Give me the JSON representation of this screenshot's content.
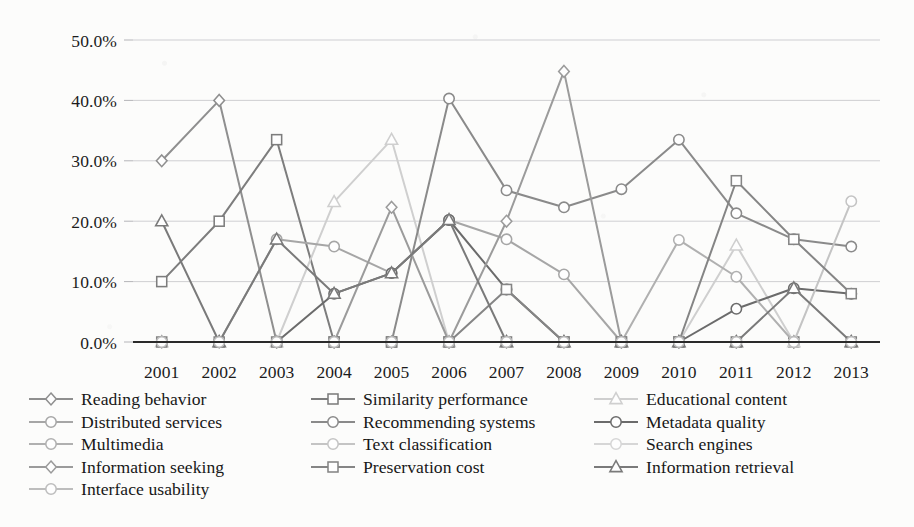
{
  "chart_data": {
    "type": "line",
    "title": "",
    "subtitle": "",
    "xlabel": "",
    "ylabel": "",
    "categories": [
      "2001",
      "2002",
      "2003",
      "2004",
      "2005",
      "2006",
      "2007",
      "2008",
      "2009",
      "2010",
      "2011",
      "2012",
      "2013"
    ],
    "x": [
      2001,
      2002,
      2003,
      2004,
      2005,
      2006,
      2007,
      2008,
      2009,
      2010,
      2011,
      2012,
      2013
    ],
    "ylim": [
      0,
      50
    ],
    "y_tick_labels": [
      "0.0%",
      "10.0%",
      "20.0%",
      "30.0%",
      "40.0%",
      "50.0%"
    ],
    "y_tick_values": [
      0,
      10,
      20,
      30,
      40,
      50
    ],
    "y_unit": "%",
    "grid": "horizontal",
    "legend_position": "bottom",
    "legend_columns": 3,
    "series": [
      {
        "name": "Reading behavior",
        "marker": "diamond",
        "color": "#8f8f8f",
        "values": [
          30.0,
          40.0,
          0.0,
          0.0,
          0.0,
          0.0,
          0.0,
          0.0,
          0.0,
          0.0,
          0.0,
          0.0,
          0.0
        ]
      },
      {
        "name": "Similarity performance",
        "marker": "square",
        "color": "#7d7d7d",
        "values": [
          10.0,
          20.0,
          33.5,
          0.0,
          0.0,
          0.0,
          0.0,
          0.0,
          0.0,
          0.0,
          0.0,
          0.0,
          0.0
        ]
      },
      {
        "name": "Educational content",
        "marker": "triangle",
        "color": "#cfcfcf",
        "values": [
          0.0,
          0.0,
          0.0,
          23.2,
          33.5,
          0.0,
          0.0,
          0.0,
          0.0,
          0.0,
          16.0,
          0.0,
          0.0
        ]
      },
      {
        "name": "Distributed services",
        "marker": "circle",
        "color": "#a6a6a6",
        "values": [
          0.0,
          0.0,
          17.0,
          15.8,
          11.4,
          20.2,
          17.0,
          11.2,
          0.0,
          0.0,
          0.0,
          0.0,
          0.0
        ]
      },
      {
        "name": "Recommending systems",
        "marker": "circle",
        "color": "#8a8a8a",
        "values": [
          0.0,
          0.0,
          0.0,
          0.0,
          0.0,
          40.3,
          25.1,
          22.3,
          25.3,
          33.5,
          21.3,
          17.0,
          15.8
        ]
      },
      {
        "name": "Metadata quality",
        "marker": "circle",
        "color": "#6b6b6b",
        "values": [
          0.0,
          0.0,
          0.0,
          8.0,
          11.4,
          20.2,
          8.7,
          0.0,
          0.0,
          0.0,
          5.5,
          8.9,
          8.0
        ]
      },
      {
        "name": "Multimedia",
        "marker": "circle",
        "color": "#b0b0b0",
        "values": [
          0.0,
          0.0,
          0.0,
          0.0,
          0.0,
          0.0,
          0.0,
          0.0,
          0.0,
          16.9,
          10.8,
          0.0,
          0.0
        ]
      },
      {
        "name": "Text classification",
        "marker": "circle",
        "color": "#c4c4c4",
        "values": [
          0.0,
          0.0,
          0.0,
          0.0,
          0.0,
          0.0,
          0.0,
          0.0,
          0.0,
          0.0,
          0.0,
          0.0,
          23.3
        ]
      },
      {
        "name": "Search engines",
        "marker": "circle",
        "color": "#d6d6d6",
        "values": [
          0.0,
          0.0,
          0.0,
          0.0,
          0.0,
          0.0,
          0.0,
          0.0,
          0.0,
          0.0,
          0.0,
          0.0,
          0.0
        ]
      },
      {
        "name": "Information seeking",
        "marker": "diamond",
        "color": "#9b9b9b",
        "values": [
          0.0,
          0.0,
          0.0,
          0.0,
          22.3,
          0.0,
          20.0,
          44.8,
          0.0,
          0.0,
          0.0,
          0.0,
          0.0
        ]
      },
      {
        "name": "Preservation cost",
        "marker": "square",
        "color": "#858585",
        "values": [
          0.0,
          0.0,
          0.0,
          0.0,
          0.0,
          0.0,
          8.7,
          0.0,
          0.0,
          0.0,
          26.7,
          17.0,
          8.0
        ]
      },
      {
        "name": "Information retrieval",
        "marker": "triangle",
        "color": "#7a7a7a",
        "values": [
          20.0,
          0.0,
          17.0,
          8.0,
          11.4,
          20.2,
          0.0,
          0.0,
          0.0,
          0.0,
          0.0,
          8.9,
          0.0
        ]
      },
      {
        "name": "Interface usability",
        "marker": "circle",
        "color": "#bdbdbd",
        "values": [
          0.0,
          0.0,
          0.0,
          0.0,
          0.0,
          0.0,
          0.0,
          0.0,
          0.0,
          0.0,
          0.0,
          0.0,
          0.0
        ]
      }
    ]
  },
  "axes": {
    "y_labels": [
      "50.0%",
      "40.0%",
      "30.0%",
      "20.0%",
      "10.0%",
      "0.0%"
    ],
    "x_labels": [
      "2001",
      "2002",
      "2003",
      "2004",
      "2005",
      "2006",
      "2007",
      "2008",
      "2009",
      "2010",
      "2011",
      "2012",
      "2013"
    ]
  },
  "legend": {
    "columns": [
      {
        "items": [
          {
            "label": "Reading behavior",
            "marker": "diamond",
            "color": "#8f8f8f"
          },
          {
            "label": "Distributed services",
            "marker": "circle",
            "color": "#a6a6a6"
          },
          {
            "label": "Multimedia",
            "marker": "circle",
            "color": "#b0b0b0"
          },
          {
            "label": "Information seeking",
            "marker": "diamond",
            "color": "#9b9b9b"
          },
          {
            "label": "Interface usability",
            "marker": "circle",
            "color": "#bdbdbd"
          }
        ]
      },
      {
        "items": [
          {
            "label": "Similarity performance",
            "marker": "square",
            "color": "#7d7d7d"
          },
          {
            "label": "Recommending systems",
            "marker": "circle",
            "color": "#8a8a8a"
          },
          {
            "label": "Text classification",
            "marker": "circle",
            "color": "#c4c4c4"
          },
          {
            "label": "Preservation cost",
            "marker": "square",
            "color": "#858585"
          }
        ]
      },
      {
        "items": [
          {
            "label": "Educational content",
            "marker": "triangle",
            "color": "#cfcfcf"
          },
          {
            "label": "Metadata quality",
            "marker": "circle",
            "color": "#6b6b6b"
          },
          {
            "label": "Search engines",
            "marker": "circle",
            "color": "#d6d6d6"
          },
          {
            "label": "Information retrieval",
            "marker": "triangle",
            "color": "#7a7a7a"
          }
        ]
      }
    ]
  }
}
